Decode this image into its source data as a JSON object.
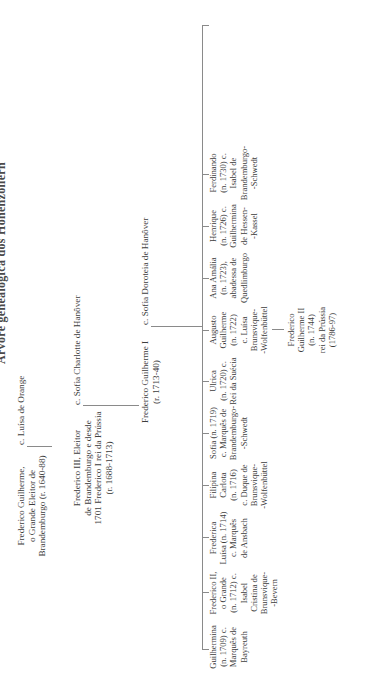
{
  "title": "Árvore genealógica dos Hohenzollern",
  "colors": {
    "text": "#3d3d3d",
    "lines": "#8a8a8a",
    "background": "#ffffff"
  },
  "generation1": {
    "person": [
      "Frederico Guilherme,",
      "o Grande Eleitor de",
      "Brandemburgo (r. 1640-88)"
    ],
    "spouse": "c. Luísa de Orange"
  },
  "generation2": {
    "person": [
      "Frederico III, Eleitor",
      "de Brandemburgo e desde",
      "1701 Frederico I rei da Prússia",
      "(r. 1688-1713)"
    ],
    "spouse": "c. Sofia Charlotte de Hanôver"
  },
  "generation3": {
    "person": [
      "Frederico Guilherme I",
      "(r. 1713-40)"
    ],
    "spouse": "c. Sofia Doroteia de Hanôver"
  },
  "children": [
    {
      "lines": [
        "Guilhermina",
        "(n. 1709) c.",
        "Marquês de",
        "Bayreuth"
      ]
    },
    {
      "lines": [
        "Frederico II,",
        "o Grande",
        "(n. 1712) c.",
        "Isabel",
        "Cristina de",
        "Brunsvique-",
        "-Bevern"
      ]
    },
    {
      "lines": [
        "Frederica",
        "Luísa (n. 1714)",
        "c. Marquês",
        "de Ansbach"
      ]
    },
    {
      "lines": [
        "Filipina",
        "Carlota",
        "(n. 1716)",
        "c. Duque de",
        "Brunsvique-",
        "-Wolfenbüttel"
      ]
    },
    {
      "lines": [
        "Sofia (n. 1719)",
        "c. Marquês de",
        "Brandemburgo-",
        "-Schwedt"
      ]
    },
    {
      "lines": [
        "Ulrica",
        "(n. 1720) c.",
        "Rei da Suécia"
      ]
    },
    {
      "lines": [
        "Augusto",
        "Guilherme",
        "(n. 1722)",
        "c. Luísa",
        "Brunsvique-",
        "-Wolfenbüttel"
      ]
    },
    {
      "lines": [
        "Ana Amália",
        "(n. 1723),",
        "abadessa de",
        "Quedlimburgo"
      ]
    },
    {
      "lines": [
        "Henrique",
        "(n. 1726) c.",
        "Guilhermina",
        "de Hessen-",
        "-Kassel"
      ]
    },
    {
      "lines": [
        "Ferdinando",
        "(n. 1730) c.",
        "Isabel de",
        "Brandemburgo-",
        "-Schwedt"
      ]
    }
  ],
  "grandchild": {
    "lines": [
      "Frederico",
      "Guilherme II",
      "(n. 1744)",
      "rei da Prússia",
      "(1786-97)"
    ]
  }
}
